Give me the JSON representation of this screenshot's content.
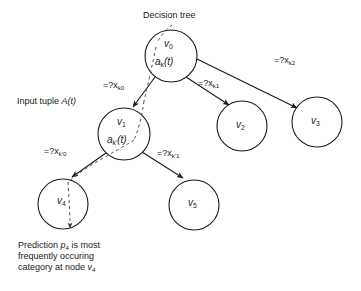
{
  "figure": {
    "title": "Decision tree",
    "input_label_prefix": "Input tuple ",
    "input_label_value": "A(t)",
    "caption_line1_a": "Prediction ",
    "caption_line1_var": "p",
    "caption_line1_sub": "4",
    "caption_line1_b": " is most",
    "caption_line2": "frequently occuring",
    "caption_line3_a": "category at node ",
    "caption_line3_var": "v",
    "caption_line3_sub": "4",
    "stroke_color": "#1a1a1a",
    "dash_color": "#555555",
    "background": "#ffffff"
  },
  "nodes": [
    {
      "id": "v0",
      "name": "v",
      "sub": "0",
      "attr": "a",
      "attr_sub": "k",
      "attr_tail": "(t)",
      "cx": 171,
      "cy": 56,
      "r": 26,
      "has_attr": true
    },
    {
      "id": "v1",
      "name": "v",
      "sub": "1",
      "attr": "a",
      "attr_sub": "k'",
      "attr_tail": "(t)",
      "cx": 124,
      "cy": 134,
      "r": 26,
      "has_attr": true
    },
    {
      "id": "v2",
      "name": "v",
      "sub": "2",
      "cx": 242,
      "cy": 126,
      "r": 25,
      "has_attr": false
    },
    {
      "id": "v3",
      "name": "v",
      "sub": "3",
      "cx": 317,
      "cy": 122,
      "r": 25,
      "has_attr": false
    },
    {
      "id": "v4",
      "name": "v",
      "sub": "4",
      "cx": 63,
      "cy": 204,
      "r": 25,
      "has_attr": false
    },
    {
      "id": "v5",
      "name": "v",
      "sub": "5",
      "cx": 194,
      "cy": 205,
      "r": 25,
      "has_attr": false
    }
  ],
  "edges": [
    {
      "id": "v0-v1",
      "from": "v0",
      "to": "v1",
      "label_pre": "=?x",
      "label_sub": "k0",
      "lx": 103,
      "ly": 80
    },
    {
      "id": "v0-v2",
      "from": "v0",
      "to": "v2",
      "label_pre": "=?x",
      "label_sub": "k1",
      "lx": 198,
      "ly": 78
    },
    {
      "id": "v0-v3",
      "from": "v0",
      "to": "v3",
      "label_pre": "=?x",
      "label_sub": "k2",
      "lx": 274,
      "ly": 55
    },
    {
      "id": "v1-v4",
      "from": "v1",
      "to": "v4",
      "label_pre": "=?x",
      "label_sub": "k'0",
      "lx": 44,
      "ly": 146
    },
    {
      "id": "v1-v5",
      "from": "v1",
      "to": "v5",
      "label_pre": "=?x",
      "label_sub": "k'1",
      "lx": 157,
      "ly": 148
    }
  ],
  "annotations": {
    "decision_tree_pointer": "dashed-leader-line",
    "traversal_path": "dashed-path-v0-v1-v4"
  }
}
